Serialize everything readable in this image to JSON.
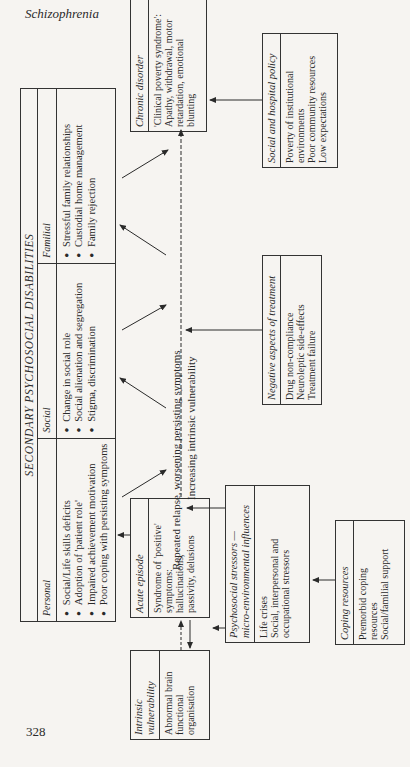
{
  "page": {
    "running_head": "Schizophrenia",
    "page_number": "328"
  },
  "secondary": {
    "title": "SECONDARY PSYCHOSOCIAL DISABILITIES",
    "columns": [
      {
        "header": "Personal",
        "items": [
          "Social/Life skills deficits",
          "Adoption of 'patient role'",
          "Impaired achievement motivation",
          "Poor coping with persisting symptoms"
        ]
      },
      {
        "header": "Social",
        "items": [
          "Change in social role",
          "Social alienation and segregation",
          "Stigma, discrimination"
        ]
      },
      {
        "header": "Familial",
        "items": [
          "Stressful family relationships",
          "Custodial home management",
          "Family rejection"
        ]
      }
    ]
  },
  "chronic": {
    "header": "Chronic disorder",
    "lines": [
      "'Clinical poverty syndrome':",
      "Apathy, withdrawal, motor",
      "retardation, emotional",
      "blunting"
    ]
  },
  "policy": {
    "header": "Social and hospital policy",
    "lines": [
      "Poverty of institutional",
      "environments",
      "Poor community resources",
      "Low expectations"
    ]
  },
  "treatment": {
    "header": "Negative aspects of treatment",
    "lines": [
      "Drug non-compliance",
      "Neuroleptic side-effects",
      "Treatment failure"
    ]
  },
  "acute": {
    "header": "Acute episode",
    "lines": [
      "Syndrome of 'positive'",
      "symptoms:",
      "hallucinations,",
      "passivity, delusions"
    ]
  },
  "stressors": {
    "header_line1": "Psychosocial stressors —",
    "header_line2": "micro-environmental influences",
    "lines": [
      "Life crises",
      "Social, interpersonal and",
      "occupational stressors"
    ]
  },
  "coping": {
    "header": "Coping resources",
    "lines": [
      "Premorbid coping",
      "resources",
      "Social/familial support"
    ]
  },
  "vulnerability": {
    "header_line1": "Intrinsic",
    "header_line2": "vulnerability",
    "lines": [
      "Abnormal brain",
      "functional",
      "organisation"
    ]
  },
  "flow_labels": {
    "line1": "Repeated relapse,      worsening persisting symptoms",
    "line2": "Increasing intrinsic vulnerability"
  }
}
